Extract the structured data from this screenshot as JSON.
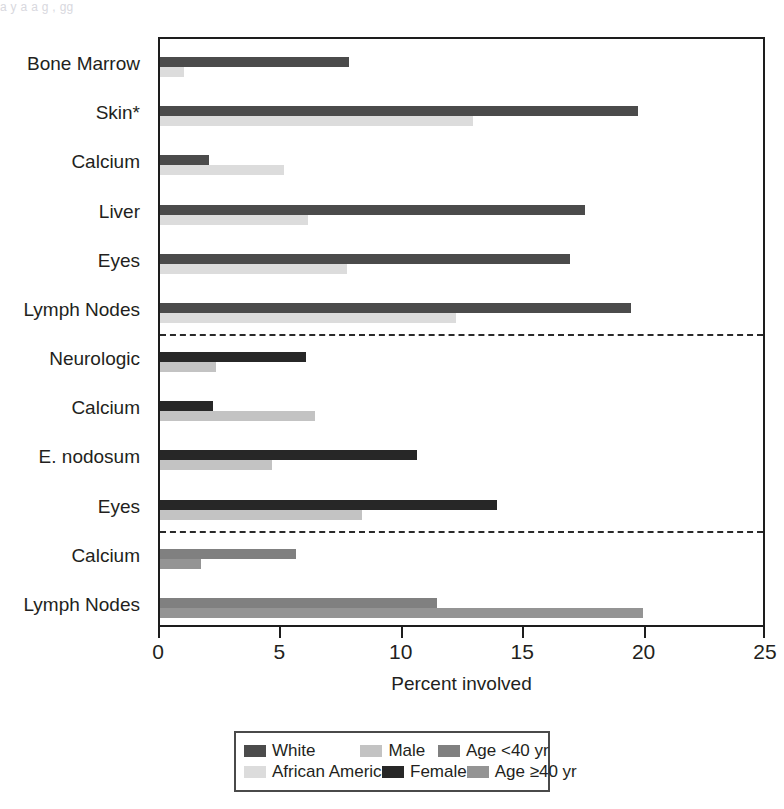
{
  "figure": {
    "top_remnant_text": "a  y       a  a g                                                  ,      gg"
  },
  "axis": {
    "xlabel": "Percent involved",
    "xticks": [
      "0",
      "5",
      "10",
      "15",
      "20",
      "25"
    ],
    "xlim": [
      0,
      25
    ]
  },
  "legend": {
    "entries": [
      {
        "label": "White",
        "color": "#4b4b4b"
      },
      {
        "label": "African American",
        "color": "#dcdcdc"
      },
      {
        "label": "Male",
        "color": "#c3c3c3"
      },
      {
        "label": "Female",
        "color": "#272727"
      },
      {
        "label": "Age <40 yr",
        "color": "#808080"
      },
      {
        "label": "Age ≥40 yr",
        "color": "#949494"
      }
    ]
  },
  "chart_data": {
    "type": "bar",
    "orientation": "horizontal",
    "title": "",
    "xlabel": "Percent involved",
    "ylabel": "",
    "xlim": [
      0,
      25
    ],
    "xticks": [
      0,
      5,
      10,
      15,
      20,
      25
    ],
    "grid": false,
    "legend_position": "bottom",
    "group_dividers_after_categories": [
      "Lymph Nodes (race)",
      "Eyes (sex)"
    ],
    "groups": [
      {
        "name": "Race",
        "series": [
          {
            "name": "White",
            "color": "#4b4b4b"
          },
          {
            "name": "African American",
            "color": "#dcdcdc"
          }
        ],
        "categories": [
          "Bone Marrow",
          "Skin*",
          "Calcium",
          "Liver",
          "Eyes",
          "Lymph Nodes"
        ],
        "values": {
          "White": [
            7.8,
            19.7,
            2.0,
            17.5,
            16.9,
            19.4
          ],
          "African American": [
            1.0,
            12.9,
            5.1,
            6.1,
            7.7,
            12.2
          ]
        }
      },
      {
        "name": "Sex",
        "series": [
          {
            "name": "Female",
            "color": "#272727"
          },
          {
            "name": "Male",
            "color": "#c3c3c3"
          }
        ],
        "categories": [
          "Neurologic",
          "Calcium",
          "E. nodosum",
          "Eyes"
        ],
        "values": {
          "Female": [
            6.0,
            2.2,
            10.6,
            13.9
          ],
          "Male": [
            2.3,
            6.4,
            4.6,
            8.3
          ]
        }
      },
      {
        "name": "Age",
        "series": [
          {
            "name": "Age <40 yr",
            "color": "#808080"
          },
          {
            "name": "Age ≥40 yr",
            "color": "#949494"
          }
        ],
        "categories": [
          "Calcium",
          "Lymph Nodes"
        ],
        "values": {
          "Age <40 yr": [
            5.6,
            11.4
          ],
          "Age ≥40 yr": [
            1.7,
            19.9
          ]
        }
      }
    ],
    "rows": [
      {
        "category": "Bone Marrow",
        "group": "Race",
        "upper_series": "White",
        "upper_value": 7.8,
        "lower_series": "African American",
        "lower_value": 1.0
      },
      {
        "category": "Skin*",
        "group": "Race",
        "upper_series": "White",
        "upper_value": 19.7,
        "lower_series": "African American",
        "lower_value": 12.9
      },
      {
        "category": "Calcium",
        "group": "Race",
        "upper_series": "White",
        "upper_value": 2.0,
        "lower_series": "African American",
        "lower_value": 5.1
      },
      {
        "category": "Liver",
        "group": "Race",
        "upper_series": "White",
        "upper_value": 17.5,
        "lower_series": "African American",
        "lower_value": 6.1
      },
      {
        "category": "Eyes",
        "group": "Race",
        "upper_series": "White",
        "upper_value": 16.9,
        "lower_series": "African American",
        "lower_value": 7.7
      },
      {
        "category": "Lymph Nodes",
        "group": "Race",
        "upper_series": "White",
        "upper_value": 19.4,
        "lower_series": "African American",
        "lower_value": 12.2
      },
      {
        "category": "Neurologic",
        "group": "Sex",
        "upper_series": "Female",
        "upper_value": 6.0,
        "lower_series": "Male",
        "lower_value": 2.3
      },
      {
        "category": "Calcium",
        "group": "Sex",
        "upper_series": "Female",
        "upper_value": 2.2,
        "lower_series": "Male",
        "lower_value": 6.4
      },
      {
        "category": "E. nodosum",
        "group": "Sex",
        "upper_series": "Female",
        "upper_value": 10.6,
        "lower_series": "Male",
        "lower_value": 4.6
      },
      {
        "category": "Eyes",
        "group": "Sex",
        "upper_series": "Female",
        "upper_value": 13.9,
        "lower_series": "Male",
        "lower_value": 8.3
      },
      {
        "category": "Calcium",
        "group": "Age",
        "upper_series": "Age <40 yr",
        "upper_value": 5.6,
        "lower_series": "Age ≥40 yr",
        "lower_value": 1.7
      },
      {
        "category": "Lymph Nodes",
        "group": "Age",
        "upper_series": "Age <40 yr",
        "upper_value": 11.4,
        "lower_series": "Age ≥40 yr",
        "lower_value": 19.9
      }
    ]
  }
}
